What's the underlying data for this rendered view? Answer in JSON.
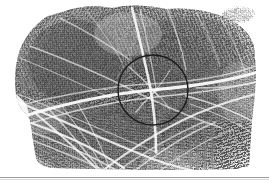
{
  "figure": {
    "kind": "forensic-palm-print-impression",
    "medium": "halftone print reproduction",
    "canvas": {
      "width": 269,
      "height": 188
    },
    "background_color": "#ffffff"
  },
  "print": {
    "label": "palm print impression",
    "description": "Inked friction-ridge impression of a palm showing dense ridge flow crossed by pale flexion creases",
    "bounds": {
      "x": 14,
      "y": 6,
      "width": 243,
      "height": 164
    },
    "ridge_color_dark": "#4a4a4a",
    "ridge_color_mid": "#7d7d7d",
    "ridge_color_light": "#b8b8b8",
    "crease_color": "#f2f2f2",
    "paper_color": "#fefefe"
  },
  "annotation": {
    "label": "region of interest marker",
    "shape": "circle",
    "center_x": 153,
    "center_y": 90,
    "radius": 35,
    "stroke_color": "#1c1c1c",
    "stroke_width": 1.4,
    "fill": "none"
  },
  "smudge": {
    "label": "partial secondary smudge",
    "bounds": {
      "x": 222,
      "y": 6,
      "width": 32,
      "height": 19
    },
    "color": "#c9c9c9"
  },
  "rule": {
    "label": "horizontal rule beneath figure",
    "y": 177,
    "color": "#9a9a9a",
    "shadow_color": "#d8d8d8"
  }
}
